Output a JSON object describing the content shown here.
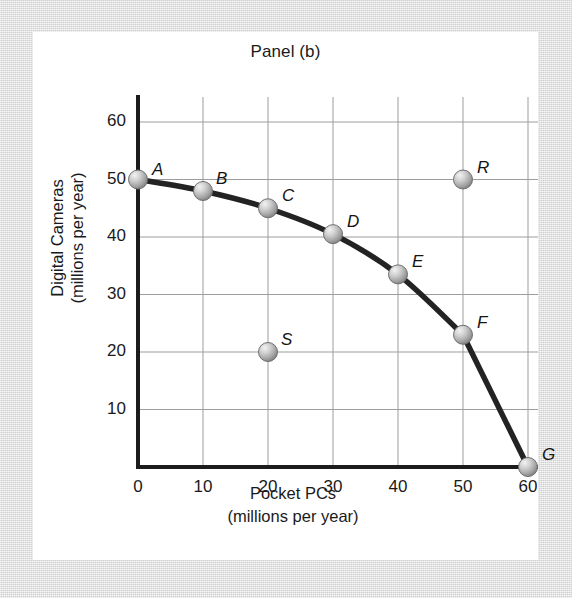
{
  "frame": {
    "background_color": "#d6d6d6",
    "card_color": "#ffffff"
  },
  "chart_data": {
    "type": "line",
    "title": "Panel (b)",
    "xlabel": "Pocket PCs",
    "xlabel_units": "(millions per year)",
    "ylabel": "Digital Cameras",
    "ylabel_units": "(millions per year)",
    "xlim": [
      0,
      60
    ],
    "ylim": [
      0,
      60
    ],
    "xticks": [
      0,
      10,
      20,
      30,
      40,
      50,
      60
    ],
    "yticks": [
      10,
      20,
      30,
      40,
      50,
      60
    ],
    "grid": true,
    "legend": "none",
    "series": [
      {
        "name": "Production possibilities frontier",
        "type": "line",
        "color": "#232323",
        "x": [
          0,
          10,
          20,
          30,
          40,
          50,
          60
        ],
        "y": [
          50,
          48,
          45,
          40.5,
          33.5,
          23,
          0
        ],
        "point_labels": [
          "A",
          "B",
          "C",
          "D",
          "E",
          "F",
          "G"
        ]
      },
      {
        "name": "Unattainable point",
        "type": "scatter",
        "color": "#9a9a9a",
        "x": [
          50
        ],
        "y": [
          50
        ],
        "point_labels": [
          "R"
        ]
      },
      {
        "name": "Inefficient point",
        "type": "scatter",
        "color": "#9a9a9a",
        "x": [
          20
        ],
        "y": [
          20
        ],
        "point_labels": [
          "S"
        ]
      }
    ],
    "points": [
      {
        "label": "A",
        "x": 0,
        "y": 50,
        "label_dx": 14,
        "label_dy": -20
      },
      {
        "label": "B",
        "x": 10,
        "y": 48,
        "label_dx": 13,
        "label_dy": -22
      },
      {
        "label": "C",
        "x": 20,
        "y": 45,
        "label_dx": 14,
        "label_dy": -22
      },
      {
        "label": "D",
        "x": 30,
        "y": 40.5,
        "label_dx": 14,
        "label_dy": -22
      },
      {
        "label": "E",
        "x": 40,
        "y": 33.5,
        "label_dx": 14,
        "label_dy": -22
      },
      {
        "label": "F",
        "x": 50,
        "y": 23,
        "label_dx": 14,
        "label_dy": -22
      },
      {
        "label": "G",
        "x": 60,
        "y": 0,
        "label_dx": 14,
        "label_dy": -22
      },
      {
        "label": "R",
        "x": 50,
        "y": 50,
        "label_dx": 14,
        "label_dy": -22
      },
      {
        "label": "S",
        "x": 20,
        "y": 20,
        "label_dx": 13,
        "label_dy": -22
      }
    ]
  },
  "axes": {
    "y_tick_labels": [
      "60",
      "50",
      "40",
      "30",
      "20",
      "10"
    ],
    "x_tick_labels": [
      "0",
      "10",
      "20",
      "30",
      "40",
      "50",
      "60"
    ]
  }
}
